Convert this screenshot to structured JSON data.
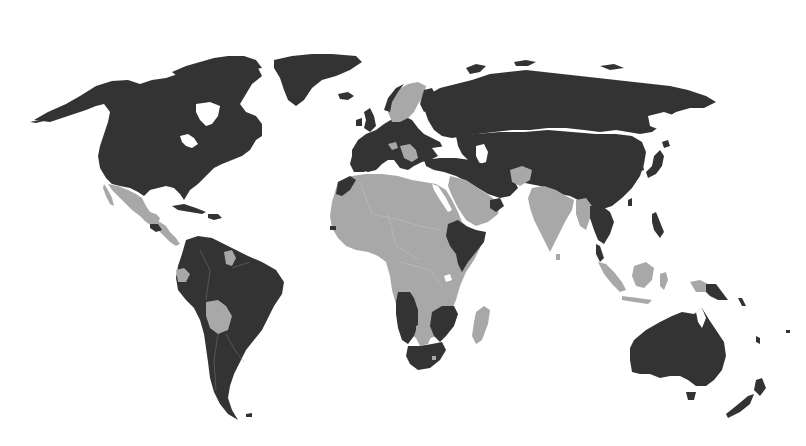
{
  "map": {
    "type": "choropleth-world-map",
    "projection": "robinson-like",
    "background_color": "#ffffff",
    "categories": [
      {
        "name": "category-a",
        "color": "#333333"
      },
      {
        "name": "category-b",
        "color": "#a8a8a8"
      }
    ],
    "regions": [
      {
        "id": "north-america-us-canada",
        "category": "category-a"
      },
      {
        "id": "alaska",
        "category": "category-a"
      },
      {
        "id": "greenland",
        "category": "category-a"
      },
      {
        "id": "mexico",
        "category": "category-b"
      },
      {
        "id": "central-america",
        "category": "category-b"
      },
      {
        "id": "caribbean",
        "category": "category-a"
      },
      {
        "id": "south-america",
        "category": "category-a"
      },
      {
        "id": "ecuador",
        "category": "category-b"
      },
      {
        "id": "bolivia",
        "category": "category-b"
      },
      {
        "id": "guyana",
        "category": "category-b"
      },
      {
        "id": "europe",
        "category": "category-a"
      },
      {
        "id": "scandinavia",
        "category": "category-b"
      },
      {
        "id": "balkans",
        "category": "category-b"
      },
      {
        "id": "russia",
        "category": "category-a"
      },
      {
        "id": "middle-east-turkey-iran",
        "category": "category-a"
      },
      {
        "id": "arabian-peninsula",
        "category": "category-b"
      },
      {
        "id": "afghanistan",
        "category": "category-b"
      },
      {
        "id": "china-mongolia-central-asia",
        "category": "category-a"
      },
      {
        "id": "india",
        "category": "category-b"
      },
      {
        "id": "myanmar",
        "category": "category-b"
      },
      {
        "id": "indochina",
        "category": "category-a"
      },
      {
        "id": "japan",
        "category": "category-a"
      },
      {
        "id": "philippines",
        "category": "category-a"
      },
      {
        "id": "indonesia",
        "category": "category-b"
      },
      {
        "id": "papua-new-guinea",
        "category": "category-a"
      },
      {
        "id": "north-africa-sub-saharan",
        "category": "category-b"
      },
      {
        "id": "morocco",
        "category": "category-a"
      },
      {
        "id": "horn-of-africa",
        "category": "category-a"
      },
      {
        "id": "angola-namibia",
        "category": "category-a"
      },
      {
        "id": "botswana",
        "category": "category-b"
      },
      {
        "id": "mozambique-zimbabwe",
        "category": "category-a"
      },
      {
        "id": "south-africa",
        "category": "category-a"
      },
      {
        "id": "madagascar",
        "category": "category-b"
      },
      {
        "id": "australia",
        "category": "category-a"
      },
      {
        "id": "new-zealand",
        "category": "category-a"
      }
    ]
  }
}
